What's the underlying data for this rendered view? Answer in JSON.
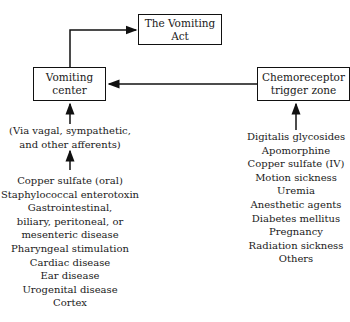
{
  "nodes": {
    "act": {
      "label": "The Vomiting Act"
    },
    "center": {
      "line1": "Vomiting",
      "line2": "center"
    },
    "ctz": {
      "line1": "Chemoreceptor",
      "line2": "trigger zone"
    }
  },
  "afferents": {
    "line1": "(Via vagal, sympathetic,",
    "line2": "and other afferents)"
  },
  "left_causes": [
    "Copper sulfate (oral)",
    "Staphylococcal enterotoxin",
    "Gastrointestinal,",
    "biliary, peritoneal, or",
    "mesenteric disease",
    "Pharyngeal stimulation",
    "Cardiac disease",
    "Ear disease",
    "Urogenital disease",
    "Cortex"
  ],
  "right_causes": [
    "Digitalis glycosides",
    "Apomorphine",
    "Copper sulfate (IV)",
    "Motion sickness",
    "Uremia",
    "Anesthetic agents",
    "Diabetes mellitus",
    "Pregnancy",
    "Radiation sickness",
    "Others"
  ]
}
